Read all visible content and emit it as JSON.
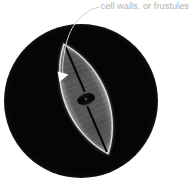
{
  "figure": {
    "type": "micrograph-diagram",
    "background_color": "#ffffff",
    "field": {
      "name": "dark-field-circle",
      "shape": "circle",
      "center_x": 81,
      "center_y": 101,
      "radius": 77,
      "color": "#050505"
    },
    "specimen": {
      "name": "diatom-valve",
      "shape": "lanceolate",
      "center_x": 86,
      "center_y": 99,
      "length": 118,
      "width": 42,
      "rotation_deg": -22,
      "outline_color": "#c9c9c9",
      "body_color": "#4a4a4a",
      "striae_color": "#8c8c8c",
      "raphe_color": "#060606",
      "central_nodule_color": "#050505"
    }
  },
  "annotation": {
    "label": "cell walls, or frustules",
    "label_color": "#b2b2b2",
    "leader": {
      "name": "leader-line",
      "color": "#d0d0d0",
      "stroke_width": 1,
      "start_x": 98,
      "start_y": 8,
      "end_x": 63,
      "end_y": 76,
      "curved": true
    },
    "arrowhead": {
      "name": "arrowhead",
      "color": "#ffffff",
      "tip_x": 59,
      "tip_y": 82,
      "points_direction": "down-left"
    }
  }
}
